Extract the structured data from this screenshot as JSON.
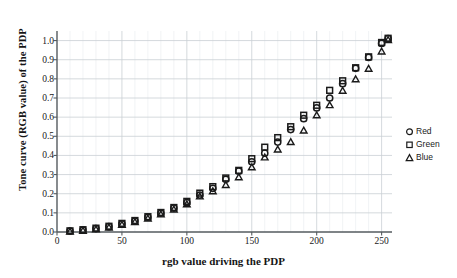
{
  "chart_data": {
    "type": "scatter",
    "title": "",
    "xlabel": "rgb value driving the PDP",
    "ylabel": "Tone curve (RGB value) of the PDP",
    "xlim": [
      0,
      258
    ],
    "ylim": [
      0.0,
      1.05
    ],
    "xticks": [
      0,
      50,
      100,
      150,
      200,
      250
    ],
    "xticklabels": [
      "0",
      "50",
      "100",
      "150",
      "200",
      "250"
    ],
    "yticks": [
      0.0,
      0.1,
      0.2,
      0.3,
      0.4,
      0.5,
      0.6,
      0.7,
      0.8,
      0.9,
      1.0
    ],
    "yticklabels": [
      "0.0",
      "0.1",
      "0.2",
      "0.3",
      "0.4",
      "0.5",
      "0.6",
      "0.7",
      "0.8",
      "0.9",
      "1.0"
    ],
    "grid": "horizontal-major and vertical-minor",
    "legend_position": "right-outside",
    "x": [
      10,
      20,
      30,
      40,
      50,
      60,
      70,
      80,
      90,
      100,
      110,
      120,
      130,
      140,
      150,
      160,
      170,
      180,
      190,
      200,
      210,
      220,
      230,
      240,
      250,
      255
    ],
    "series": [
      {
        "name": "Red",
        "marker": "circle",
        "color": "#1a1a1a",
        "values": [
          0.005,
          0.01,
          0.018,
          0.028,
          0.042,
          0.057,
          0.077,
          0.098,
          0.125,
          0.153,
          0.193,
          0.228,
          0.275,
          0.318,
          0.367,
          0.412,
          0.47,
          0.535,
          0.592,
          0.648,
          0.7,
          0.775,
          0.855,
          0.912,
          0.985,
          1.01
        ]
      },
      {
        "name": "Green",
        "marker": "square",
        "color": "#1a1a1a",
        "values": [
          0.006,
          0.012,
          0.02,
          0.03,
          0.045,
          0.06,
          0.08,
          0.102,
          0.128,
          0.16,
          0.203,
          0.237,
          0.282,
          0.322,
          0.383,
          0.443,
          0.493,
          0.55,
          0.61,
          0.662,
          0.74,
          0.79,
          0.858,
          0.915,
          0.99,
          1.012
        ]
      },
      {
        "name": "Blue",
        "marker": "triangle",
        "color": "#1a1a1a",
        "values": [
          0.004,
          0.009,
          0.016,
          0.026,
          0.04,
          0.054,
          0.073,
          0.094,
          0.12,
          0.147,
          0.188,
          0.215,
          0.248,
          0.288,
          0.34,
          0.392,
          0.433,
          0.472,
          0.532,
          0.612,
          0.665,
          0.74,
          0.8,
          0.855,
          0.945,
          1.005
        ]
      }
    ]
  },
  "legend": {
    "items": [
      {
        "label": "Red",
        "marker": "circle"
      },
      {
        "label": "Green",
        "marker": "square"
      },
      {
        "label": "Blue",
        "marker": "triangle"
      }
    ]
  }
}
